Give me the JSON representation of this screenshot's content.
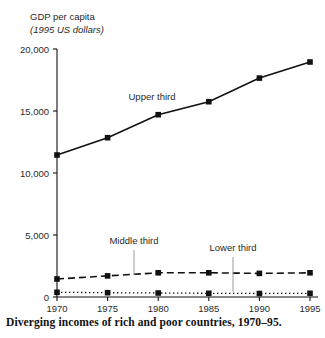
{
  "axis_title": {
    "line1": "GDP per capita",
    "line2": "(1995 US dollars)"
  },
  "caption": "Diverging incomes of rich and poor countries, 1970–95.",
  "annotations": {
    "upper": "Upper third",
    "middle": "Middle third",
    "lower": "Lower third"
  },
  "colors": {
    "line": "#111111",
    "text": "#2a2a2a",
    "leader": "#9a9a9a",
    "background": "#ffffff"
  },
  "chart_data": {
    "type": "line",
    "title": "Diverging incomes of rich and poor countries, 1970–95.",
    "xlabel": "",
    "ylabel": "GDP per capita (1995 US dollars)",
    "categories": [
      "1970",
      "1975",
      "1980",
      "1985",
      "1990",
      "1995"
    ],
    "x": [
      1970,
      1975,
      1980,
      1985,
      1990,
      1995
    ],
    "xlim": [
      1970,
      1995
    ],
    "ylim": [
      0,
      20000
    ],
    "yticks": [
      0,
      5000,
      10000,
      15000,
      20000
    ],
    "ytick_labels": [
      "0",
      "5,000",
      "10,000",
      "15,000",
      "20,000"
    ],
    "xticks": [
      1970,
      1975,
      1980,
      1985,
      1990,
      1995
    ],
    "xtick_labels": [
      "1970",
      "1975",
      "1980",
      "1985",
      "1990",
      "1995"
    ],
    "grid": false,
    "legend": "inline annotations",
    "series": [
      {
        "name": "Upper third",
        "style": "solid",
        "marker": "square",
        "values": [
          11450,
          12850,
          14700,
          15750,
          17650,
          18950
        ]
      },
      {
        "name": "Middle third",
        "style": "dashed",
        "marker": "square",
        "values": [
          1450,
          1700,
          1950,
          1950,
          1900,
          1950
        ]
      },
      {
        "name": "Lower third",
        "style": "dotted",
        "marker": "square",
        "values": [
          380,
          350,
          320,
          300,
          280,
          300
        ]
      }
    ]
  }
}
